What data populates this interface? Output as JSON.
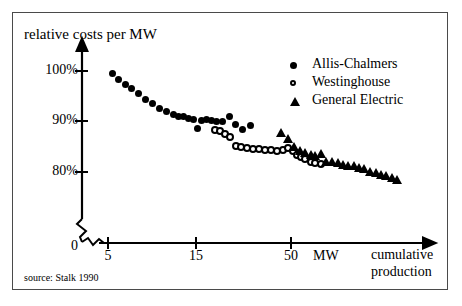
{
  "figure": {
    "source_note": "source: Stalk 1990",
    "axis_break_marks": "zigzag"
  },
  "chart_data": {
    "type": "scatter",
    "title": "relative costs per MW",
    "xlabel": "cumulative production",
    "x_unit": "MW",
    "ylabel": "relative costs per MW",
    "x_scale": "log",
    "x_ticks": [
      5,
      15,
      50
    ],
    "x_tick_labels": [
      "5",
      "15",
      "50"
    ],
    "y_ticks": [
      0,
      80,
      90,
      100
    ],
    "y_tick_labels": [
      "0",
      "80%",
      "90%",
      "100%"
    ],
    "ylim": [
      78,
      102
    ],
    "grid": false,
    "legend_position": "top-right",
    "series": [
      {
        "name": "Allis-Chalmers",
        "marker": "filled-circle",
        "color": "#000000",
        "points": [
          [
            5.3,
            99.6
          ],
          [
            5.7,
            98.4
          ],
          [
            6.2,
            97.4
          ],
          [
            6.7,
            96.6
          ],
          [
            7.3,
            95.5
          ],
          [
            8.0,
            94.4
          ],
          [
            8.8,
            93.6
          ],
          [
            9.6,
            92.6
          ],
          [
            10.5,
            92.0
          ],
          [
            11.4,
            91.3
          ],
          [
            12.2,
            91.0
          ],
          [
            13.0,
            90.9
          ],
          [
            13.8,
            90.6
          ],
          [
            14.6,
            90.3
          ],
          [
            15.4,
            88.7
          ],
          [
            16.2,
            90.2
          ],
          [
            17.2,
            90.3
          ],
          [
            18.4,
            90.1
          ],
          [
            19.6,
            90.0
          ],
          [
            21.0,
            90.0
          ],
          [
            23.0,
            90.9
          ],
          [
            25.0,
            89.4
          ],
          [
            27.0,
            88.4
          ],
          [
            30.0,
            89.3
          ]
        ]
      },
      {
        "name": "Westinghouse",
        "marker": "open-circle",
        "color": "#000000",
        "points": [
          [
            19.2,
            88.4
          ],
          [
            20.4,
            88.2
          ],
          [
            21.8,
            87.6
          ],
          [
            23.2,
            86.9
          ],
          [
            25.0,
            85.2
          ],
          [
            26.8,
            85.0
          ],
          [
            28.6,
            84.8
          ],
          [
            31.0,
            84.6
          ],
          [
            33.5,
            84.5
          ],
          [
            36.0,
            84.4
          ],
          [
            39.0,
            84.3
          ],
          [
            42.0,
            84.2
          ],
          [
            45.0,
            84.3
          ],
          [
            48.0,
            84.8
          ],
          [
            51.0,
            84.1
          ],
          [
            54.0,
            83.3
          ],
          [
            57.0,
            82.9
          ],
          [
            60.0,
            82.5
          ],
          [
            64.0,
            81.9
          ],
          [
            68.0,
            81.8
          ],
          [
            73.0,
            81.6
          ]
        ]
      },
      {
        "name": "General Electric",
        "marker": "filled-triangle",
        "color": "#000000",
        "points": [
          [
            44.0,
            87.9
          ],
          [
            48.0,
            86.6
          ],
          [
            52.0,
            85.1
          ],
          [
            56.0,
            84.3
          ],
          [
            60.0,
            83.8
          ],
          [
            64.0,
            83.4
          ],
          [
            68.0,
            83.2
          ],
          [
            73.0,
            83.6
          ],
          [
            78.0,
            82.1
          ],
          [
            84.0,
            82.0
          ],
          [
            90.0,
            81.9
          ],
          [
            96.0,
            81.4
          ],
          [
            103.0,
            81.3
          ],
          [
            110.0,
            81.2
          ],
          [
            118.0,
            80.8
          ],
          [
            126.0,
            80.7
          ],
          [
            135.0,
            80.1
          ],
          [
            145.0,
            79.9
          ],
          [
            155.0,
            79.5
          ],
          [
            166.0,
            79.3
          ],
          [
            178.0,
            78.9
          ],
          [
            190.0,
            78.6
          ]
        ]
      }
    ]
  },
  "axes": {
    "y_labels": {
      "t100": "100%",
      "t90": "90%",
      "t80": "80%",
      "t0": "0"
    },
    "x_labels": {
      "t5": "5",
      "t15": "15",
      "t50": "50",
      "unit": "MW",
      "title": "cumulative production"
    }
  },
  "legend": {
    "entries": [
      {
        "label": "Allis-Chalmers",
        "marker": "filled-circle"
      },
      {
        "label": "Westinghouse",
        "marker": "open-circle"
      },
      {
        "label": "General Electric",
        "marker": "filled-triangle"
      }
    ]
  }
}
